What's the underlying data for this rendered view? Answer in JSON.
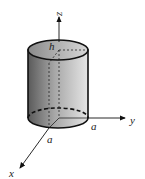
{
  "diagram": {
    "type": "3d-cylinder-on-axes",
    "axes": {
      "x": "x",
      "y": "y",
      "z": "z"
    },
    "labels": {
      "height": "h",
      "radius_y": "a",
      "radius_x": "a"
    },
    "colors": {
      "stroke": "#111111",
      "fill_dark": "#6e6e6e",
      "fill_light": "#e8e8e8"
    }
  }
}
